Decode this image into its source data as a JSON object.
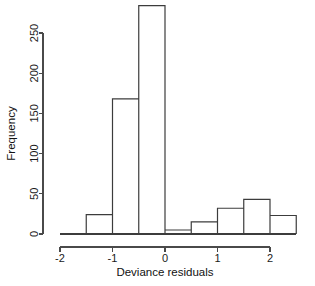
{
  "chart_data": {
    "type": "bar",
    "chart_subtype": "histogram",
    "title": "",
    "xlabel": "Deviance residuals",
    "ylabel": "Frequency",
    "bin_width": 0.5,
    "bin_edges": [
      -2,
      -1.5,
      -1,
      -0.5,
      0,
      0.5,
      1,
      1.5,
      2,
      2.5
    ],
    "categories": [
      "-2 to -1.5",
      "-1.5 to -1",
      "-1 to -0.5",
      "-0.5 to 0",
      "0 to 0.5",
      "0.5 to 1",
      "1 to 1.5",
      "1.5 to 2",
      "2 to 2.5"
    ],
    "values": [
      0,
      24,
      168,
      284,
      5,
      15,
      32,
      43,
      23
    ],
    "xlim": [
      -2,
      2.5
    ],
    "ylim": [
      0,
      284
    ],
    "xticks": [
      -2,
      -1,
      0,
      1,
      2
    ],
    "xticklabels": [
      "-2",
      "-1",
      "0",
      "1",
      "2"
    ],
    "yticks": [
      0,
      50,
      100,
      150,
      200,
      250
    ],
    "yticklabels": [
      "0",
      "50",
      "100",
      "150",
      "200",
      "250"
    ],
    "grid": false,
    "legend": false,
    "bar_fill": "#ffffff",
    "bar_stroke": "#3c3c3c",
    "axis_color": "#4a4a4a"
  },
  "axes": {
    "x_title": "Deviance residuals",
    "y_title": "Frequency"
  }
}
